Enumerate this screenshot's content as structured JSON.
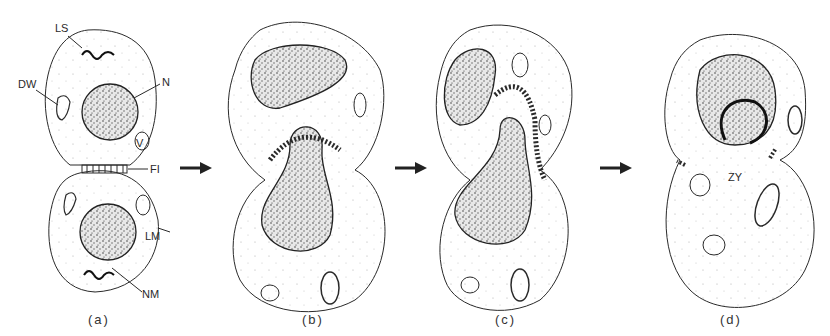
{
  "figure": {
    "panels": [
      {
        "id": "a",
        "caption": "(a)"
      },
      {
        "id": "b",
        "caption": "(b)"
      },
      {
        "id": "c",
        "caption": "(c)"
      },
      {
        "id": "d",
        "caption": "(d)"
      }
    ],
    "labels": {
      "ls": "LS",
      "dw": "DW",
      "n": "N",
      "fi": "FI",
      "lm": "LM",
      "nm": "NM",
      "zy": "ZY",
      "v": "V"
    },
    "arrows": [
      "a-to-b",
      "b-to-c",
      "c-to-d"
    ],
    "colors": {
      "line": "#2a2a2a",
      "stipple": "#555555",
      "background": "#ffffff"
    }
  }
}
